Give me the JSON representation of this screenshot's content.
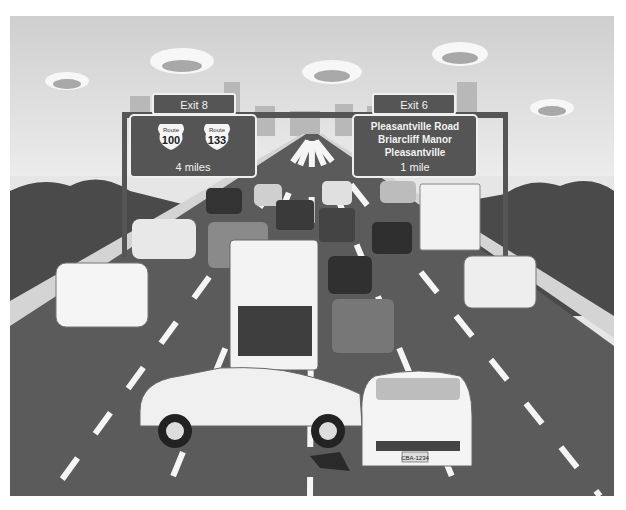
{
  "scene": {
    "description": "Illustrated congested highway with two overhead exit signs and a two-car collision in the foreground",
    "palette": {
      "sky": "#e4e4e4",
      "cloud": "#f7f7f7",
      "cloud_shadow": "#9a9a9a",
      "road": "#5b5b5b",
      "lane_marking": "#f5f5f5",
      "guardrail": "#c9c9c9",
      "trees": "#4a4a4a",
      "sign_bg": "#555555",
      "sign_border": "#f0f0f0",
      "building": "#b3b3b3"
    }
  },
  "signs": {
    "left": {
      "exit_label": "Exit 8",
      "shields": [
        {
          "top": "Route",
          "number": "100"
        },
        {
          "top": "Route",
          "number": "133"
        }
      ],
      "distance": "4 miles"
    },
    "right": {
      "exit_label": "Exit 6",
      "lines": [
        "Pleasantville Road",
        "Briarcliff Manor",
        "Pleasantville"
      ],
      "distance": "1 mile"
    }
  },
  "vehicles": {
    "crash": {
      "left_car": "white hatchback (side view)",
      "right_car": "white sedan (front view)",
      "plate": "CBA-1234"
    },
    "traffic": [
      "truck",
      "cars",
      "box truck"
    ]
  }
}
